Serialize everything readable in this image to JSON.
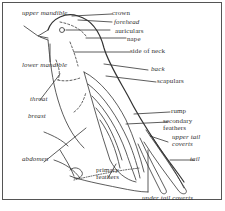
{
  "diagram": {
    "labels": {
      "upper_mandible": "upper mandible",
      "lower_mandible": "lower mandible",
      "throat": "throat",
      "breast": "breast",
      "abdomen": "abdomen",
      "primary_feathers": "primary feathers",
      "crown": "crown",
      "forehead": "forehead",
      "auriculars": "auriculars",
      "nape": "nape",
      "side_of_neck": "side of neck",
      "back": "back",
      "scapulars": "scapulars",
      "rump": "rump",
      "secondary_feathers": "secondary feathers",
      "upper_tail_coverts": "upper tail coverts",
      "tail": "tail",
      "under_tail_coverts": "under tail coverts"
    },
    "colors": {
      "line": "#333333",
      "border": "#555555",
      "background": "#ffffff"
    }
  }
}
